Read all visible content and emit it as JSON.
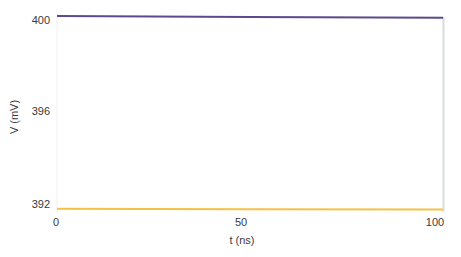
{
  "chart_data": {
    "type": "line",
    "title": "",
    "xlabel": "t (ns)",
    "ylabel": "V (mV)",
    "xlim": [
      0,
      102
    ],
    "ylim": [
      391.6,
      400.3
    ],
    "xticks": [
      0,
      50,
      100
    ],
    "yticks": [
      392,
      396,
      400
    ],
    "grid": false,
    "legend": null,
    "series": [
      {
        "name": "upper trace",
        "color": "#5b4a8c",
        "x": [
          0,
          50,
          101
        ],
        "values": [
          400.04,
          400.0,
          399.97
        ]
      },
      {
        "name": "lower trace",
        "color": "#f5c044",
        "x": [
          0,
          50,
          101
        ],
        "values": [
          391.8,
          391.78,
          391.76
        ]
      }
    ]
  },
  "labels": {
    "xlabel": "t (ns)",
    "ylabel": "V (mV)",
    "xtick_0": "0",
    "xtick_1": "50",
    "xtick_2": "100",
    "ytick_0": "392",
    "ytick_1": "396",
    "ytick_2": "400"
  }
}
